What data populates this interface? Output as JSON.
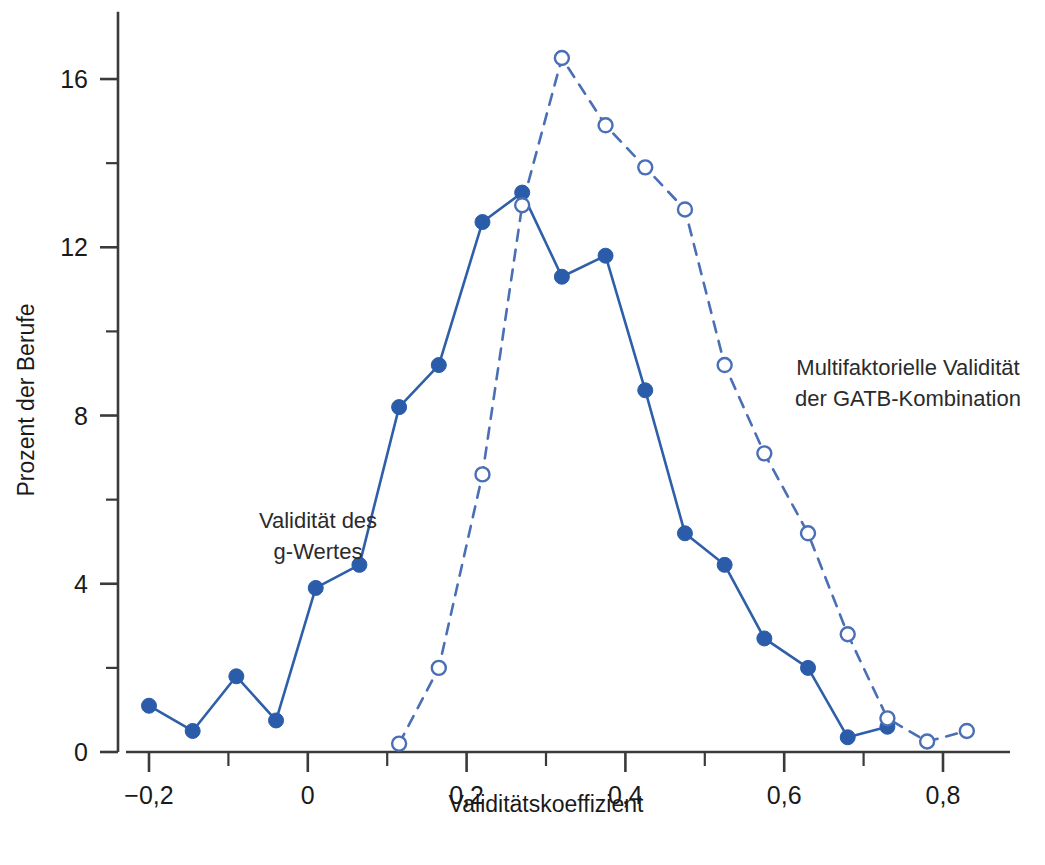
{
  "chart_data": {
    "type": "line",
    "title": "",
    "xlabel": "Validitätskoeffizient",
    "ylabel": "Prozent der Berufe",
    "xlim": [
      -0.23,
      0.87
    ],
    "ylim": [
      0,
      17.6
    ],
    "grid": false,
    "legend_position": "inline-annotations",
    "x_major_ticks": [
      -0.2,
      0,
      0.2,
      0.4,
      0.6,
      0.8
    ],
    "x_major_tick_labels": [
      "−0,2",
      "0",
      "0,2",
      "0,4",
      "0,6",
      "0,8"
    ],
    "x_minor_ticks": [
      -0.1,
      0.1,
      0.3,
      0.5,
      0.7
    ],
    "y_major_ticks": [
      0,
      4,
      8,
      12,
      16
    ],
    "y_major_tick_labels": [
      "0",
      "4",
      "8",
      "12",
      "16"
    ],
    "y_minor_ticks": [
      2,
      6,
      10,
      14
    ],
    "colors": {
      "series_solid": "#2f5fa8",
      "series_dashed": "#4a6fb5",
      "marker_filled": "#2a5caa",
      "marker_open_fill": "#ffffff",
      "axis": "#3a3a3a",
      "text": "#1a1a1a"
    },
    "series": [
      {
        "name": "Validität des g-Wertes",
        "style": "solid",
        "marker": "filled-circle",
        "x": [
          -0.2,
          -0.145,
          -0.09,
          -0.04,
          0.01,
          0.065,
          0.115,
          0.165,
          0.22,
          0.27,
          0.32,
          0.375,
          0.425,
          0.475,
          0.525,
          0.575,
          0.63,
          0.68,
          0.73
        ],
        "values": [
          1.1,
          0.5,
          1.8,
          0.75,
          3.9,
          4.45,
          8.2,
          9.2,
          12.6,
          13.3,
          11.3,
          11.8,
          8.6,
          5.2,
          4.45,
          2.7,
          2.0,
          0.35,
          0.6
        ]
      },
      {
        "name": "Multifaktorielle Validität der GATB-Kombination",
        "style": "dashed",
        "marker": "open-circle",
        "x": [
          0.115,
          0.165,
          0.22,
          0.27,
          0.32,
          0.375,
          0.425,
          0.475,
          0.525,
          0.575,
          0.63,
          0.68,
          0.73,
          0.78,
          0.83
        ],
        "values": [
          0.2,
          2.0,
          6.6,
          13.0,
          16.5,
          14.9,
          13.9,
          12.9,
          9.2,
          7.1,
          5.2,
          2.8,
          0.8,
          0.25,
          0.5
        ]
      }
    ],
    "annotations": [
      {
        "id": "annotation-solid",
        "lines": [
          "Validität des",
          "g-Wertes"
        ],
        "align": "center",
        "x_px": 318,
        "y_px": 528
      },
      {
        "id": "annotation-dashed",
        "lines": [
          "Multifaktorielle Validität",
          "der GATB-Kombination"
        ],
        "align": "center",
        "x_px": 908,
        "y_px": 375
      }
    ]
  }
}
